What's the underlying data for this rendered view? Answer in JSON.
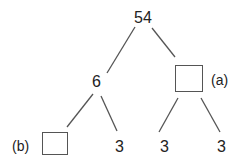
{
  "tree": {
    "root": {
      "value": "54"
    },
    "left": {
      "value": "6",
      "children": [
        {
          "value": "",
          "blank": true,
          "label": "(b)"
        },
        {
          "value": "3"
        }
      ]
    },
    "right": {
      "value": "",
      "blank": true,
      "label": "(a)",
      "children": [
        {
          "value": "3"
        },
        {
          "value": "3"
        }
      ]
    }
  },
  "colors": {
    "line": "#555555",
    "text": "#222222"
  }
}
